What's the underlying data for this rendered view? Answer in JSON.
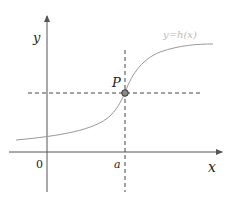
{
  "diagram": {
    "type": "function-graph",
    "curve_label": "y=h(x)",
    "axes": {
      "x_label": "x",
      "y_label": "y",
      "origin_label": "0"
    },
    "point": {
      "label": "P",
      "x_tick_label": "a"
    },
    "colors": {
      "axis": "#555555",
      "curve": "#999999",
      "dashed": "#444444",
      "curve_label": "#bbbbbb"
    }
  }
}
